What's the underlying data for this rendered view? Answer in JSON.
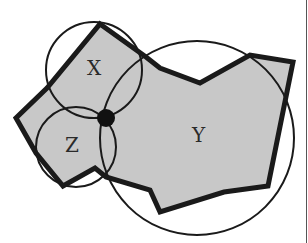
{
  "diagram": {
    "type": "polygon-with-circles",
    "colors": {
      "background": "#ffffff",
      "polygon_fill": "#c8c8c8",
      "stroke": "#1a1a1a",
      "dot": "#111111",
      "right_border": "#555555"
    },
    "labels": {
      "x": "X",
      "y": "Y",
      "z": "Z"
    },
    "polygon_points": "100,24 146,57 160,68 200,83 250,55 293,62 268,186 224,192 160,212 150,190 106,177 95,168 63,186 36,153 16,118 47,88",
    "circles": [
      {
        "name": "circle-x",
        "cx": 94,
        "cy": 70,
        "r": 48
      },
      {
        "name": "circle-y",
        "cx": 197,
        "cy": 138,
        "r": 97
      },
      {
        "name": "circle-z",
        "cx": 76,
        "cy": 147,
        "r": 40
      }
    ],
    "center_dot": {
      "cx": 106,
      "cy": 118,
      "r": 9
    }
  }
}
